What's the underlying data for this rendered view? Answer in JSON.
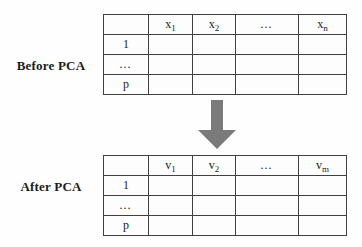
{
  "before": {
    "label": "Before PCA",
    "columns": [
      {
        "base": "",
        "sub": ""
      },
      {
        "base": "x",
        "sub": "1"
      },
      {
        "base": "x",
        "sub": "2"
      },
      {
        "base": "…",
        "sub": ""
      },
      {
        "base": "x",
        "sub": "n"
      }
    ],
    "rows": [
      "1",
      "…",
      "p"
    ]
  },
  "after": {
    "label": "After PCA",
    "columns": [
      {
        "base": "",
        "sub": ""
      },
      {
        "base": "v",
        "sub": "1"
      },
      {
        "base": "v",
        "sub": "2"
      },
      {
        "base": "…",
        "sub": ""
      },
      {
        "base": "v",
        "sub": "m"
      }
    ],
    "rows": [
      "1",
      "…",
      "p"
    ]
  },
  "arrow": {
    "direction": "down",
    "color": "#7a7a7a"
  }
}
